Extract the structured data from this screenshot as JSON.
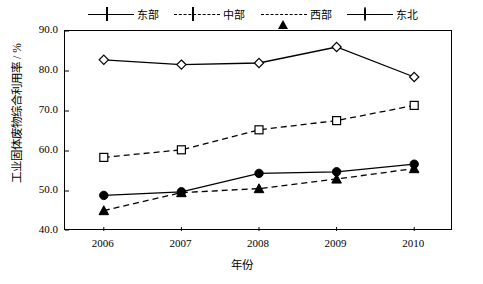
{
  "chart_data": {
    "type": "line",
    "title": "",
    "xlabel": "年份",
    "ylabel": "工业固体废物综合利用率 / %",
    "categories": [
      "2006",
      "2007",
      "2008",
      "2009",
      "2010"
    ],
    "xlim": [
      2005.5,
      2010.5
    ],
    "ylim": [
      40.0,
      90.0
    ],
    "ytick_labels": [
      "40.0",
      "50.0",
      "60.0",
      "70.0",
      "80.0",
      "90.0"
    ],
    "ytick_values": [
      40.0,
      50.0,
      60.0,
      70.0,
      80.0,
      90.0
    ],
    "grid": false,
    "legend_position": "top",
    "series": [
      {
        "name": "东部",
        "marker": "diamond-open",
        "linestyle": "solid",
        "color": "#000000",
        "values": [
          82.8,
          81.6,
          82.0,
          86.0,
          78.5
        ]
      },
      {
        "name": "中部",
        "marker": "square-open",
        "linestyle": "dashed",
        "color": "#000000",
        "values": [
          58.4,
          60.3,
          65.3,
          67.6,
          71.4
        ]
      },
      {
        "name": "西部",
        "marker": "triangle-filled",
        "linestyle": "dashed",
        "color": "#000000",
        "values": [
          45.1,
          49.6,
          50.6,
          53.0,
          55.6
        ]
      },
      {
        "name": "东北",
        "marker": "circle-filled",
        "linestyle": "solid",
        "color": "#000000",
        "values": [
          48.9,
          49.8,
          54.4,
          54.8,
          56.7
        ]
      }
    ]
  }
}
